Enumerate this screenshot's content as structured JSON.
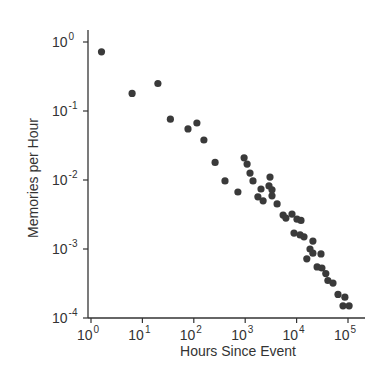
{
  "chart_data": {
    "type": "scatter",
    "title": "",
    "xlabel": "Hours Since Event",
    "ylabel": "Memories per Hour",
    "xscale": "log",
    "yscale": "log",
    "xlim": [
      1,
      100000
    ],
    "ylim": [
      0.0001,
      1
    ],
    "grid": false,
    "legend": null,
    "x_ticks": [
      {
        "base": "10",
        "exp": "0",
        "value": 1
      },
      {
        "base": "10",
        "exp": "1",
        "value": 10
      },
      {
        "base": "10",
        "exp": "2",
        "value": 100
      },
      {
        "base": "10",
        "exp": "3",
        "value": 1000
      },
      {
        "base": "10",
        "exp": "4",
        "value": 10000
      },
      {
        "base": "10",
        "exp": "5",
        "value": 100000
      }
    ],
    "y_ticks": [
      {
        "base": "10",
        "exp": "0",
        "value": 1
      },
      {
        "base": "10",
        "exp": "-1",
        "value": 0.1
      },
      {
        "base": "10",
        "exp": "-2",
        "value": 0.01
      },
      {
        "base": "10",
        "exp": "-3",
        "value": 0.001
      },
      {
        "base": "10",
        "exp": "-4",
        "value": 0.0001
      }
    ],
    "series": [
      {
        "name": "memories",
        "color": "#3a3a3a",
        "points": [
          [
            1.6,
            0.72
          ],
          [
            6.3,
            0.18
          ],
          [
            20,
            0.25
          ],
          [
            35,
            0.076
          ],
          [
            77,
            0.055
          ],
          [
            115,
            0.067
          ],
          [
            157,
            0.038
          ],
          [
            260,
            0.018
          ],
          [
            405,
            0.0097
          ],
          [
            720,
            0.0067
          ],
          [
            950,
            0.021
          ],
          [
            1090,
            0.017
          ],
          [
            1240,
            0.0126
          ],
          [
            1420,
            0.0097
          ],
          [
            2030,
            0.0074
          ],
          [
            1770,
            0.0057
          ],
          [
            2230,
            0.005
          ],
          [
            3040,
            0.011
          ],
          [
            3320,
            0.0072
          ],
          [
            2900,
            0.0082
          ],
          [
            3320,
            0.0059
          ],
          [
            4170,
            0.0045
          ],
          [
            5470,
            0.0031
          ],
          [
            6200,
            0.0028
          ],
          [
            8130,
            0.0032
          ],
          [
            10200,
            0.0027
          ],
          [
            12200,
            0.0026
          ],
          [
            8900,
            0.0017
          ],
          [
            11700,
            0.0016
          ],
          [
            13900,
            0.0015
          ],
          [
            20800,
            0.0013
          ],
          [
            18200,
            0.001
          ],
          [
            20800,
            0.00087
          ],
          [
            29800,
            0.00085
          ],
          [
            15800,
            0.00072
          ],
          [
            25000,
            0.00055
          ],
          [
            31000,
            0.00053
          ],
          [
            37000,
            0.00044
          ],
          [
            40700,
            0.00035
          ],
          [
            51000,
            0.00032
          ],
          [
            64000,
            0.00022
          ],
          [
            87000,
            0.0002
          ],
          [
            80000,
            0.00015
          ],
          [
            105000,
            0.00015
          ]
        ]
      }
    ]
  },
  "layout": {
    "plot_left": 88,
    "plot_bottom": 318,
    "plot_right": 365,
    "plot_top": 30,
    "x_origin_px": 91,
    "x_px_per_decade": 51.4,
    "y_origin_px": 42,
    "y_px_per_decade": 69,
    "marker_radius": 3.6
  }
}
